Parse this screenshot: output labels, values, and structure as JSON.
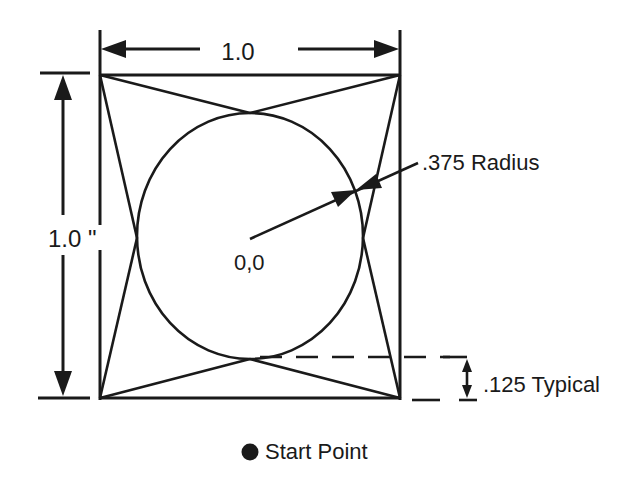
{
  "diagram": {
    "type": "technical-drawing",
    "square": {
      "x1": 100,
      "y1": 75,
      "x2": 400,
      "y2": 398,
      "side_label": "1.0"
    },
    "circle": {
      "cx": 250,
      "cy": 236,
      "rx": 113,
      "ry": 123,
      "center_label": "0,0"
    },
    "labels": {
      "width": "1.0",
      "height": "1.0 \"",
      "radius": ".375 Radius",
      "origin": "0,0",
      "offset": ".125 Typical",
      "legend": "Start Point"
    },
    "dimensions": {
      "width": {
        "value": "1.0",
        "y": 50,
        "x1": 100,
        "x2": 400
      },
      "height": {
        "value": "1.0 \"",
        "x": 63,
        "y1": 75,
        "y2": 398
      },
      "radius": {
        "value": ".375",
        "unit": "Radius"
      },
      "offset": {
        "value": ".125",
        "note": "Typical",
        "x": 467,
        "y1": 357,
        "y2": 398
      }
    },
    "legend": {
      "marker": "filled-circle",
      "label": "Start Point"
    },
    "colors": {
      "ink": "#1a1a1a",
      "background": "#ffffff"
    }
  }
}
